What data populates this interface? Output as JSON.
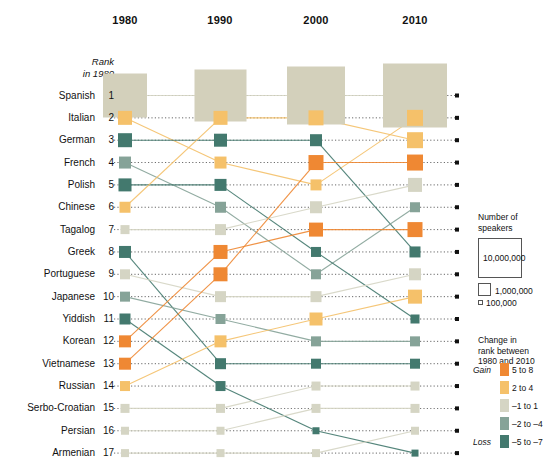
{
  "chart_data": {
    "type": "line",
    "title": "",
    "subtitle": "",
    "xlabel": "",
    "ylabel": "",
    "grid": false,
    "legend_position": "right",
    "columns": [
      "1980",
      "1990",
      "2000",
      "2010"
    ],
    "rank_note_line1": "Rank",
    "rank_note_line2": "in 1980",
    "caption": "",
    "rank_axis": [
      1,
      2,
      3,
      4,
      5,
      6,
      7,
      8,
      9,
      10,
      11,
      12,
      13,
      14,
      15,
      16,
      17
    ],
    "languages": [
      {
        "name": "Spanish",
        "rank_1980": 1,
        "ranks": [
          1,
          1,
          1,
          1
        ],
        "size": [
          44,
          52,
          58,
          64
        ],
        "change": "-1 to 1"
      },
      {
        "name": "Italian",
        "rank_1980": 2,
        "ranks": [
          2,
          4,
          5,
          2
        ],
        "size": [
          14,
          12,
          11,
          16
        ],
        "change": "2 to 4"
      },
      {
        "name": "German",
        "rank_1980": 3,
        "ranks": [
          3,
          3,
          3,
          8
        ],
        "size": [
          14,
          13,
          12,
          11
        ],
        "change": "-5 to -7"
      },
      {
        "name": "French",
        "rank_1980": 4,
        "ranks": [
          4,
          6,
          9,
          6
        ],
        "size": [
          12,
          11,
          10,
          10
        ],
        "change": "-2 to -4"
      },
      {
        "name": "Polish",
        "rank_1980": 5,
        "ranks": [
          5,
          5,
          8,
          11
        ],
        "size": [
          13,
          12,
          10,
          9
        ],
        "change": "-5 to -7"
      },
      {
        "name": "Chinese",
        "rank_1980": 6,
        "ranks": [
          6,
          2,
          2,
          3
        ],
        "size": [
          11,
          14,
          15,
          16
        ],
        "change": "2 to 4"
      },
      {
        "name": "Tagalog",
        "rank_1980": 7,
        "ranks": [
          7,
          7,
          6,
          5
        ],
        "size": [
          9,
          11,
          12,
          14
        ],
        "change": "-1 to 1"
      },
      {
        "name": "Greek",
        "rank_1980": 8,
        "ranks": [
          8,
          13,
          13,
          13
        ],
        "size": [
          12,
          11,
          10,
          10
        ],
        "change": "-5 to -7"
      },
      {
        "name": "Portuguese",
        "rank_1980": 9,
        "ranks": [
          9,
          10,
          10,
          9
        ],
        "size": [
          10,
          11,
          11,
          12
        ],
        "change": "-1 to 1"
      },
      {
        "name": "Japanese",
        "rank_1980": 10,
        "ranks": [
          10,
          11,
          12,
          12
        ],
        "size": [
          10,
          10,
          10,
          10
        ],
        "change": "-2 to -4"
      },
      {
        "name": "Yiddish",
        "rank_1980": 11,
        "ranks": [
          11,
          14,
          16,
          17
        ],
        "size": [
          11,
          10,
          7,
          7
        ],
        "change": "-5 to -7"
      },
      {
        "name": "Korean",
        "rank_1980": 12,
        "ranks": [
          12,
          8,
          7,
          7
        ],
        "size": [
          12,
          14,
          14,
          15
        ],
        "change": "5 to 8"
      },
      {
        "name": "Vietnamese",
        "rank_1980": 13,
        "ranks": [
          13,
          9,
          4,
          4
        ],
        "size": [
          12,
          14,
          15,
          16
        ],
        "change": "5 to 8"
      },
      {
        "name": "Russian",
        "rank_1980": 14,
        "ranks": [
          14,
          12,
          11,
          10
        ],
        "size": [
          10,
          12,
          13,
          14
        ],
        "change": "2 to 4"
      },
      {
        "name": "Serbo-Croatian",
        "rank_1980": 15,
        "ranks": [
          15,
          15,
          14,
          14
        ],
        "size": [
          9,
          9,
          9,
          9
        ],
        "change": "-1 to 1"
      },
      {
        "name": "Persian",
        "rank_1980": 16,
        "ranks": [
          16,
          16,
          15,
          15
        ],
        "size": [
          8,
          8,
          9,
          9
        ],
        "change": "-1 to 1"
      },
      {
        "name": "Armenian",
        "rank_1980": 17,
        "ranks": [
          17,
          17,
          17,
          16
        ],
        "size": [
          8,
          8,
          8,
          8
        ],
        "change": "-1 to 1"
      }
    ]
  },
  "legend": {
    "speakers_title": "Number of\nspeakers",
    "speakers_title_l1": "Number of",
    "speakers_title_l2": "speakers",
    "box_10m": "10,000,000",
    "box_1m": "1,000,000",
    "box_100k": "100,000",
    "change_title_l1": "Change in",
    "change_title_l2": "rank between",
    "change_title_l3": "1980 and 2010",
    "gain_label": "Gain",
    "loss_label": "Loss",
    "keys": [
      {
        "label": "5 to 8",
        "color": "#ef8833"
      },
      {
        "label": "2 to 4",
        "color": "#f5c16a"
      },
      {
        "label": "–1 to 1",
        "color": "#d5d5c4"
      },
      {
        "label": "–2 to –4",
        "color": "#86a398"
      },
      {
        "label": "–5 to –7",
        "color": "#43796e"
      }
    ]
  },
  "colors": {
    "gain_strong": "#ef8833",
    "gain_mild": "#f5c16a",
    "neutral": "#d5d5c4",
    "loss_mild": "#86a398",
    "loss_strong": "#43796e",
    "spanish_fill": "#d3d0bb",
    "dot": "#111111"
  }
}
